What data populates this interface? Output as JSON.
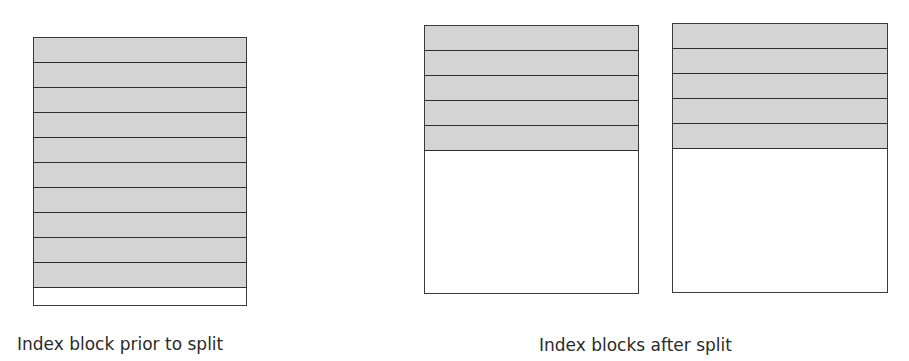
{
  "diagram": {
    "before": {
      "caption": "Index block prior to split",
      "filled_entries": 10,
      "empty_rows": 1
    },
    "after": {
      "caption": "Index blocks after split",
      "blocks": [
        {
          "filled_entries": 5
        },
        {
          "filled_entries": 5
        }
      ]
    },
    "colors": {
      "entry_fill": "#d4d4d4",
      "border": "#3a3a3a",
      "background": "#ffffff"
    }
  }
}
